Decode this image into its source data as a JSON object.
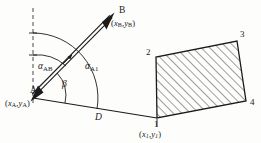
{
  "figure": {
    "background_color": "#fdfdfc",
    "line_color": "#1b1b1b",
    "hatch_color": "#2a2a2a"
  },
  "points": {
    "A": {
      "label": "A",
      "coord_open": "(",
      "coord_x": "x",
      "coord_x_sub": "A",
      "coord_comma": ",",
      "coord_y": "y",
      "coord_y_sub": "A",
      "coord_close": ")",
      "px": 33,
      "py": 98
    },
    "B": {
      "label": "B",
      "coord_open": "(",
      "coord_x": "x",
      "coord_x_sub": "B",
      "coord_comma": ",",
      "coord_y": "y",
      "coord_y_sub": "B",
      "coord_close": ")",
      "px": 113,
      "py": 17
    },
    "P1": {
      "label": "1",
      "coord_open": "(",
      "coord_x": "x",
      "coord_x_sub": "1",
      "coord_comma": ",",
      "coord_y": "y",
      "coord_y_sub": "1",
      "coord_close": ")",
      "px": 157,
      "py": 118
    }
  },
  "polygon": {
    "vertices": [
      {
        "label": "1",
        "x": 157,
        "y": 118
      },
      {
        "label": "2",
        "x": 156,
        "y": 57
      },
      {
        "label": "3",
        "x": 237,
        "y": 41
      },
      {
        "label": "4",
        "x": 246,
        "y": 101
      }
    ],
    "fill": "hatched",
    "hatch_angle_deg": 45
  },
  "angles": {
    "alpha_AB": {
      "symbol": "α",
      "subscript": "AB",
      "description": "bearing from A to B measured from north"
    },
    "alpha_A1": {
      "symbol": "α",
      "subscript": "A1",
      "description": "bearing from A to vertex 1 measured from north"
    },
    "beta": {
      "symbol": "β",
      "subscript": "",
      "description": "angle between line A-B and line A-1"
    }
  },
  "distance": {
    "label": "D",
    "description": "distance from A to vertex 1"
  },
  "north_reference": {
    "style": "dashed-vertical",
    "description": "north direction dashed line through A"
  }
}
